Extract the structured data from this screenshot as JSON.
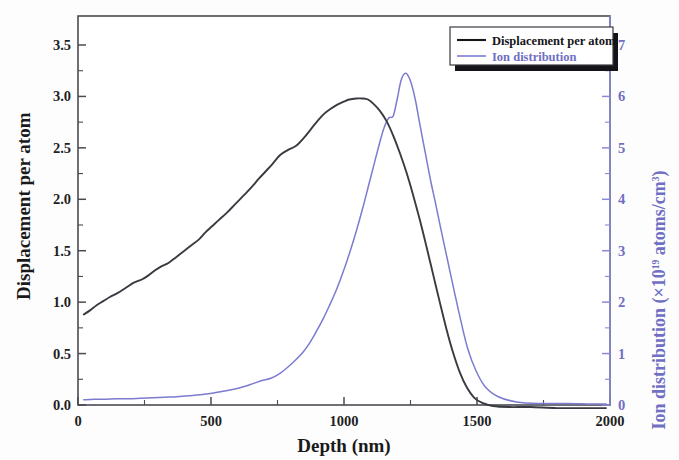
{
  "figure": {
    "background_color": "#fdfdfd",
    "frame_color": "#4a4a52",
    "series_colors": {
      "displacement": "#3a3a42",
      "ion": "#7b7bd0",
      "right_axis": "#6f6fc4"
    }
  },
  "axes": {
    "left": {
      "title": "Displacement per atom",
      "ticks": [
        "0.0",
        "0.5",
        "1.0",
        "1.5",
        "2.0",
        "2.5",
        "3.0",
        "3.5"
      ],
      "min": 0.0,
      "max": 3.5,
      "minor_per_major": 2
    },
    "bottom": {
      "title": "Depth (nm)",
      "ticks": [
        "0",
        "500",
        "1000",
        "1500",
        "2000"
      ],
      "min": 0,
      "max": 2000,
      "minor_per_major": 2
    },
    "right": {
      "title_main": "Ion distribution (×10",
      "title_sup": "19",
      "title_tail": " atoms/cm",
      "title_sup2": "3",
      "title_close": ")",
      "ticks": [
        "0",
        "1",
        "2",
        "3",
        "4",
        "5",
        "6",
        "7"
      ],
      "min": 0,
      "max": 7,
      "minor_per_major": 2
    }
  },
  "legend": {
    "items": [
      {
        "label": "Displacement per atom",
        "color": "#15151a"
      },
      {
        "label": "Ion distribution",
        "color": "#6f6fc4"
      }
    ]
  },
  "chart_data": {
    "type": "line",
    "title": "",
    "xlabel": "Depth (nm)",
    "ylabel": "Displacement per atom",
    "y2label": "Ion distribution (×10^19 atoms/cm^3)",
    "xlim": [
      0,
      2000
    ],
    "ylim": [
      0,
      3.5
    ],
    "y2lim": [
      0,
      7
    ],
    "grid": false,
    "legend_position": "top-right",
    "series": [
      {
        "name": "Displacement per atom",
        "axis": "left",
        "color": "#3a3a42",
        "x": [
          22,
          45,
          70,
          95,
          120,
          150,
          180,
          210,
          240,
          265,
          290,
          315,
          340,
          370,
          400,
          430,
          455,
          480,
          505,
          530,
          560,
          590,
          620,
          650,
          680,
          705,
          730,
          760,
          790,
          820,
          850,
          875,
          900,
          925,
          950,
          975,
          1000,
          1020,
          1045,
          1070,
          1090,
          1110,
          1135,
          1160,
          1185,
          1210,
          1235,
          1260,
          1285,
          1310,
          1335,
          1360,
          1385,
          1410,
          1435,
          1460,
          1490,
          1520,
          1560,
          1620,
          1700,
          1800,
          1900,
          1985
        ],
        "y": [
          0.88,
          0.92,
          0.97,
          1.01,
          1.05,
          1.09,
          1.14,
          1.19,
          1.22,
          1.26,
          1.31,
          1.35,
          1.38,
          1.44,
          1.5,
          1.56,
          1.61,
          1.68,
          1.74,
          1.8,
          1.87,
          1.95,
          2.03,
          2.11,
          2.2,
          2.27,
          2.34,
          2.43,
          2.48,
          2.52,
          2.6,
          2.68,
          2.76,
          2.83,
          2.88,
          2.92,
          2.95,
          2.97,
          2.98,
          2.98,
          2.97,
          2.93,
          2.86,
          2.76,
          2.62,
          2.45,
          2.26,
          2.04,
          1.8,
          1.54,
          1.27,
          1.0,
          0.74,
          0.51,
          0.32,
          0.18,
          0.07,
          0.02,
          -0.01,
          -0.02,
          -0.02,
          -0.03,
          -0.03,
          -0.03
        ]
      },
      {
        "name": "Ion distribution",
        "axis": "right",
        "color": "#7b7bd0",
        "x": [
          22,
          60,
          100,
          145,
          190,
          235,
          280,
          325,
          370,
          415,
          460,
          505,
          550,
          590,
          625,
          660,
          695,
          725,
          755,
          785,
          815,
          845,
          870,
          895,
          920,
          945,
          970,
          995,
          1020,
          1045,
          1070,
          1090,
          1110,
          1130,
          1150,
          1168,
          1185,
          1200,
          1215,
          1232,
          1250,
          1268,
          1285,
          1305,
          1325,
          1345,
          1365,
          1390,
          1415,
          1440,
          1465,
          1495,
          1530,
          1580,
          1650,
          1740,
          1840,
          1930,
          1985
        ],
        "y": [
          0.1,
          0.11,
          0.11,
          0.12,
          0.12,
          0.13,
          0.14,
          0.15,
          0.16,
          0.18,
          0.2,
          0.23,
          0.27,
          0.31,
          0.36,
          0.42,
          0.48,
          0.52,
          0.6,
          0.72,
          0.86,
          1.02,
          1.2,
          1.42,
          1.66,
          1.93,
          2.22,
          2.56,
          2.94,
          3.36,
          3.82,
          4.22,
          4.62,
          5.02,
          5.38,
          5.58,
          5.62,
          5.95,
          6.32,
          6.45,
          6.3,
          5.94,
          5.46,
          4.92,
          4.38,
          3.9,
          3.4,
          2.8,
          2.2,
          1.62,
          1.1,
          0.68,
          0.36,
          0.16,
          0.06,
          0.03,
          0.03,
          0.02,
          0.02
        ]
      }
    ]
  }
}
